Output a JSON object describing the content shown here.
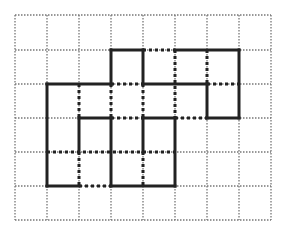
{
  "diagram": {
    "grid": {
      "columns": 8,
      "rows": 6,
      "x_lines": [
        15,
        47,
        79,
        111,
        143,
        175,
        207,
        239,
        271
      ],
      "y_lines": [
        15,
        50,
        84,
        118,
        152,
        186,
        220
      ],
      "color": "#777777"
    },
    "colors": {
      "solid": "#222222",
      "thick_dotted": "#222222",
      "background": "#ffffff"
    },
    "solid_segments": {
      "horizontal": [
        {
          "row": 1,
          "from": 3,
          "to": 4
        },
        {
          "row": 1,
          "from": 5,
          "to": 7
        },
        {
          "row": 2,
          "from": 1,
          "to": 3
        },
        {
          "row": 2,
          "from": 4,
          "to": 6
        },
        {
          "row": 3,
          "from": 2,
          "to": 3
        },
        {
          "row": 3,
          "from": 4,
          "to": 5
        },
        {
          "row": 3,
          "from": 6,
          "to": 7
        },
        {
          "row": 5,
          "from": 1,
          "to": 2
        },
        {
          "row": 5,
          "from": 3,
          "to": 5
        }
      ],
      "vertical": [
        {
          "col": 1,
          "from": 2,
          "to": 5
        },
        {
          "col": 2,
          "from": 3,
          "to": 4
        },
        {
          "col": 3,
          "from": 1,
          "to": 2
        },
        {
          "col": 3,
          "from": 3,
          "to": 5
        },
        {
          "col": 4,
          "from": 1,
          "to": 2
        },
        {
          "col": 4,
          "from": 3,
          "to": 4
        },
        {
          "col": 5,
          "from": 3,
          "to": 5
        },
        {
          "col": 6,
          "from": 2,
          "to": 3
        },
        {
          "col": 7,
          "from": 1,
          "to": 3
        }
      ]
    },
    "dotted_segments": {
      "horizontal": [
        {
          "row": 1,
          "from": 4,
          "to": 5
        },
        {
          "row": 2,
          "from": 3,
          "to": 4
        },
        {
          "row": 2,
          "from": 6,
          "to": 7
        },
        {
          "row": 3,
          "from": 3,
          "to": 4
        },
        {
          "row": 3,
          "from": 5,
          "to": 6
        },
        {
          "row": 4,
          "from": 1,
          "to": 5
        },
        {
          "row": 5,
          "from": 2,
          "to": 3
        }
      ],
      "vertical": [
        {
          "col": 2,
          "from": 2,
          "to": 3
        },
        {
          "col": 2,
          "from": 4,
          "to": 5
        },
        {
          "col": 3,
          "from": 2,
          "to": 3
        },
        {
          "col": 4,
          "from": 2,
          "to": 3
        },
        {
          "col": 4,
          "from": 4,
          "to": 5
        },
        {
          "col": 5,
          "from": 1,
          "to": 3
        },
        {
          "col": 6,
          "from": 1,
          "to": 2
        }
      ]
    }
  }
}
